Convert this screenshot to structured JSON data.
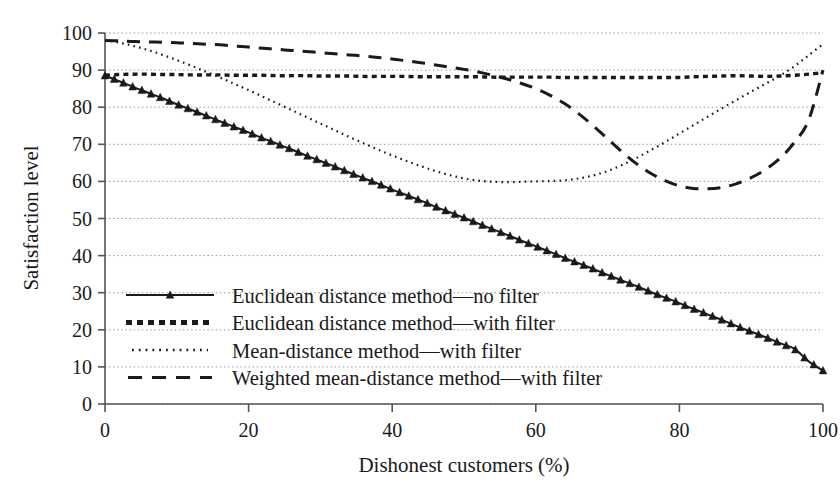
{
  "chart_data": {
    "type": "line",
    "title": "",
    "xlabel": "Dishonest customers (%)",
    "ylabel": "Satisfaction level",
    "xlim": [
      0,
      100
    ],
    "ylim": [
      0,
      100
    ],
    "xticks": [
      0,
      20,
      40,
      60,
      80,
      100
    ],
    "yticks": [
      0,
      10,
      20,
      30,
      40,
      50,
      60,
      70,
      80,
      90,
      100
    ],
    "grid": "horizontal-dotted",
    "legend_position": "lower-left-inside",
    "x": [
      0,
      2,
      4,
      6,
      8,
      10,
      12,
      14,
      16,
      18,
      20,
      22,
      24,
      26,
      28,
      30,
      32,
      34,
      36,
      38,
      40,
      42,
      44,
      46,
      48,
      50,
      52,
      54,
      56,
      58,
      60,
      62,
      64,
      66,
      68,
      70,
      72,
      74,
      76,
      78,
      80,
      82,
      84,
      86,
      88,
      90,
      92,
      94,
      96,
      98,
      100
    ],
    "series": [
      {
        "name": "Euclidean distance method—no filter",
        "style": "solid-with-triangles",
        "color": "#1a1a1a",
        "values": [
          88.5,
          87.0,
          85.4,
          83.9,
          82.4,
          80.8,
          79.3,
          77.8,
          76.2,
          74.7,
          73.2,
          71.6,
          70.1,
          68.6,
          67.0,
          65.5,
          64.0,
          62.4,
          60.9,
          59.4,
          57.8,
          56.3,
          54.8,
          53.2,
          51.7,
          50.2,
          48.6,
          47.1,
          45.6,
          44.0,
          42.5,
          41.0,
          39.4,
          37.9,
          36.4,
          34.8,
          33.3,
          31.8,
          30.2,
          28.7,
          27.2,
          25.6,
          24.1,
          22.6,
          21.0,
          19.5,
          18.0,
          16.4,
          14.9,
          11.5,
          9.0
        ]
      },
      {
        "name": "Euclidean distance method—with filter",
        "style": "dashed-squares",
        "color": "#1a1a1a",
        "values": [
          88.6,
          88.8,
          88.9,
          88.9,
          88.8,
          88.8,
          88.7,
          88.7,
          88.7,
          88.6,
          88.6,
          88.6,
          88.5,
          88.5,
          88.5,
          88.4,
          88.4,
          88.4,
          88.3,
          88.3,
          88.3,
          88.3,
          88.2,
          88.2,
          88.2,
          88.2,
          88.2,
          88.1,
          88.1,
          88.1,
          88.1,
          88.1,
          88.0,
          88.0,
          88.0,
          88.0,
          88.0,
          88.0,
          88.0,
          88.0,
          88.0,
          88.2,
          88.3,
          88.4,
          88.5,
          88.4,
          88.3,
          88.4,
          88.6,
          88.9,
          89.3
        ]
      },
      {
        "name": "Mean-distance method—with filter",
        "style": "dotted",
        "color": "#1a1a1a",
        "values": [
          98.0,
          97.4,
          96.5,
          95.4,
          94.1,
          92.7,
          91.2,
          89.6,
          88.0,
          86.3,
          84.6,
          82.8,
          81.0,
          79.2,
          77.4,
          75.6,
          73.8,
          72.0,
          70.3,
          68.6,
          67.0,
          65.5,
          64.1,
          62.8,
          61.7,
          60.8,
          60.2,
          59.9,
          59.8,
          59.9,
          60.0,
          60.1,
          60.3,
          60.8,
          61.6,
          62.8,
          64.4,
          66.3,
          68.4,
          70.6,
          72.9,
          75.2,
          77.5,
          79.8,
          82.0,
          84.2,
          86.3,
          88.5,
          91.0,
          94.0,
          97.0
        ]
      },
      {
        "name": "Weighted mean-distance method—with filter",
        "style": "long-dashed",
        "color": "#1a1a1a",
        "values": [
          98.0,
          97.9,
          97.7,
          97.6,
          97.5,
          97.4,
          97.2,
          97.0,
          96.8,
          96.5,
          96.2,
          95.9,
          95.6,
          95.3,
          95.0,
          94.7,
          94.4,
          94.1,
          93.8,
          93.4,
          93.0,
          92.5,
          92.0,
          91.4,
          90.8,
          90.2,
          89.5,
          88.6,
          87.6,
          86.4,
          85.0,
          83.2,
          81.0,
          78.2,
          75.0,
          71.5,
          68.0,
          64.8,
          62.2,
          60.2,
          58.8,
          58.1,
          58.0,
          58.4,
          59.4,
          61.0,
          63.2,
          66.2,
          70.5,
          76.5,
          90.0
        ]
      }
    ]
  },
  "legend": {
    "items": [
      {
        "label": "Euclidean distance method—no filter",
        "marker": "line-triangle-marker"
      },
      {
        "label": "Euclidean distance method—with filter",
        "marker": "dashed-square-marker"
      },
      {
        "label": "Mean-distance method—with filter",
        "marker": "dotted-marker"
      },
      {
        "label": "Weighted mean-distance method—with filter",
        "marker": "long-dash-marker"
      }
    ]
  },
  "axes": {
    "x_title": "Dishonest customers (%)",
    "y_title": "Satisfaction level",
    "x_tick_labels": [
      "0",
      "20",
      "40",
      "60",
      "80",
      "100"
    ],
    "y_tick_labels": [
      "0",
      "10",
      "20",
      "30",
      "40",
      "50",
      "60",
      "70",
      "80",
      "90",
      "100"
    ]
  },
  "colors": {
    "ink": "#1a1a1a",
    "grid": "#9a9a9a",
    "background": "#ffffff"
  }
}
